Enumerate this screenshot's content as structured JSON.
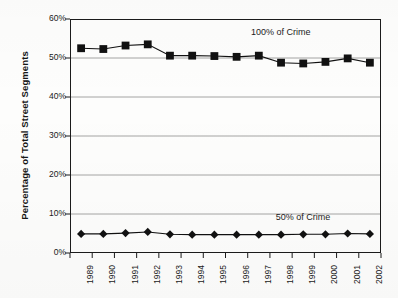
{
  "chart_data": {
    "type": "line",
    "title": "",
    "xlabel": "",
    "ylabel": "Percentage of Total Street Segments",
    "categories": [
      "1989",
      "1990",
      "1991",
      "1992",
      "1993",
      "1994",
      "1995",
      "1996",
      "1997",
      "1998",
      "1999",
      "2000",
      "2001",
      "2002"
    ],
    "ylim": [
      0,
      60
    ],
    "ytick_labels": [
      "0%",
      "10%",
      "20%",
      "30%",
      "40%",
      "50%",
      "60%"
    ],
    "ytick_values": [
      0,
      10,
      20,
      30,
      40,
      50,
      60
    ],
    "grid": true,
    "grid_axis": "y",
    "legend": "inline-annotations",
    "series": [
      {
        "name": "100% of Crime",
        "marker": "square",
        "color": "#111111",
        "values": [
          52.5,
          52.3,
          53.2,
          53.5,
          50.6,
          50.6,
          50.5,
          50.3,
          50.6,
          48.8,
          48.6,
          49.0,
          49.9,
          48.8
        ]
      },
      {
        "name": "50% of Crime",
        "marker": "diamond",
        "color": "#111111",
        "values": [
          4.9,
          4.9,
          5.1,
          5.4,
          4.8,
          4.7,
          4.7,
          4.7,
          4.7,
          4.7,
          4.8,
          4.8,
          5.0,
          4.9
        ]
      }
    ],
    "annotations": [
      {
        "text": "100% of Crime",
        "x_category": "1998",
        "y_value": 56.5
      },
      {
        "text": "50% of Crime",
        "x_category": "1999",
        "y_value": 9.0
      }
    ]
  },
  "figure": {
    "background_color": "#fdfdfc",
    "frame_color": "#1b1b1b",
    "gridline_color": "#9a9a9a"
  }
}
